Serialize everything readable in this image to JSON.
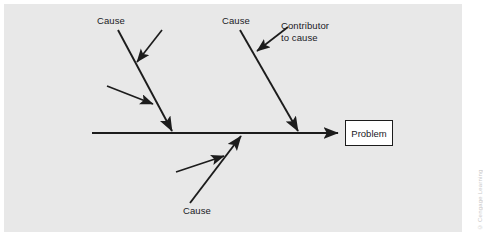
{
  "diagram": {
    "type": "fishbone-cause-and-effect",
    "background_color": "#e8e8e8",
    "page_color": "#ffffff",
    "line_color": "#1c1c1c",
    "text_color": "#20201f",
    "effect": {
      "label": "Problem",
      "box_fill": "#ffffff",
      "box_border": "#1c1c1c"
    },
    "spine": {
      "from_x": 92,
      "to_x": 342,
      "y": 133,
      "arrow": "right"
    },
    "causes": [
      {
        "id": "cause-top-left",
        "label": "Cause",
        "label_x": 97,
        "label_y": 15,
        "bone": {
          "x1": 118,
          "y1": 30,
          "x2": 173,
          "y2": 133
        },
        "contributors": [
          {
            "id": "contributor-top-left-upper",
            "x1": 162,
            "y1": 30,
            "x2": 135,
            "y2": 65
          },
          {
            "id": "contributor-top-left-lower",
            "x1": 107,
            "y1": 86,
            "x2": 155,
            "y2": 105
          }
        ]
      },
      {
        "id": "cause-top-right",
        "label": "Cause",
        "label_x": 222,
        "label_y": 15,
        "bone": {
          "x1": 240,
          "y1": 30,
          "x2": 299,
          "y2": 133
        },
        "contributors": [
          {
            "id": "contributor-top-right",
            "x1": 288,
            "y1": 27,
            "x2": 255,
            "y2": 53
          }
        ]
      },
      {
        "id": "cause-bottom",
        "label": "Cause",
        "label_x": 183,
        "label_y": 205,
        "bone": {
          "x1": 190,
          "y1": 203,
          "x2": 241,
          "y2": 134
        },
        "contributors": [
          {
            "id": "contributor-bottom",
            "x1": 176,
            "y1": 172,
            "x2": 226,
            "y2": 155
          }
        ]
      }
    ],
    "contributor_callout": {
      "label_line_1": "Contributor",
      "label_line_2": "to cause",
      "label_x": 281,
      "label_y": 20
    },
    "watermark": "© Cengage Learning"
  }
}
